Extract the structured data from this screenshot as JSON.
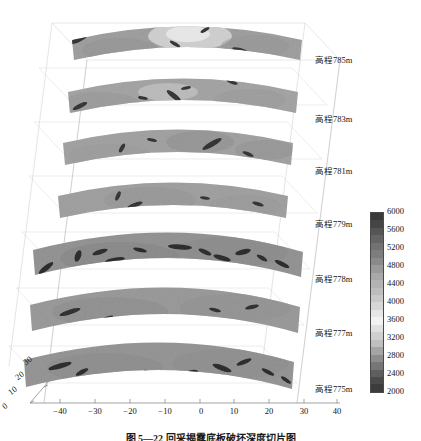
{
  "figure": {
    "kind": "3d-slice-stack",
    "background": "#ffffff",
    "caption": "图 5—22   回采揭露底板破坏深度切片图"
  },
  "chart_data": {
    "type": "heatmap",
    "title": "",
    "xlabel": "",
    "ylabel": "",
    "colorbar": {
      "label": "",
      "min": 2000,
      "max": 6000,
      "tick_step": 400,
      "ticks": [
        6000,
        5600,
        5200,
        4800,
        4400,
        4000,
        3600,
        3200,
        2800,
        2400,
        2000
      ],
      "colormap": "grayscale-banded",
      "colors": [
        "#3a3a3a",
        "#454545",
        "#555555",
        "#646464",
        "#727272",
        "#7d7d7d",
        "#8a8a8a",
        "#9a9a9a",
        "#a8a8a8",
        "#b3b3b3",
        "#bdbdbd",
        "#c9c9c9",
        "#d6d6d6",
        "#e6e6e6",
        "#f2f2f2",
        "#e0e0e0",
        "#cfcfcf",
        "#bfbfbf",
        "#a5a5a5",
        "#8d8d8d",
        "#767676",
        "#5e5e5e",
        "#4a4a4a",
        "#3c3c3c"
      ]
    },
    "x_axis": {
      "ticks": [
        -40,
        -30,
        -20,
        -10,
        0,
        10,
        20,
        30,
        40
      ],
      "labels": [
        "−40",
        "−30",
        "−20",
        "−10",
        "0",
        "10",
        "20",
        "30",
        "40"
      ],
      "range": [
        -45,
        45
      ]
    },
    "y_axis": {
      "ticks": [
        0,
        10,
        20,
        30
      ],
      "labels": [
        "0",
        "10",
        "20",
        "30"
      ],
      "range": [
        0,
        35
      ]
    },
    "z_slices": [
      {
        "index": 0,
        "label": "高程785m",
        "elevation": 785,
        "mean_value": 4300,
        "width_scale": 0.62,
        "base_color": "#9b9b9b"
      },
      {
        "index": 1,
        "label": "高程783m",
        "elevation": 783,
        "mean_value": 4200,
        "width_scale": 0.62,
        "base_color": "#a0a0a0"
      },
      {
        "index": 2,
        "label": "高程781m",
        "elevation": 781,
        "mean_value": 4150,
        "width_scale": 0.65,
        "base_color": "#9e9e9e"
      },
      {
        "index": 3,
        "label": "高程779m",
        "elevation": 779,
        "mean_value": 4100,
        "width_scale": 0.66,
        "base_color": "#9c9c9c"
      },
      {
        "index": 4,
        "label": "高程778m",
        "elevation": 778,
        "mean_value": 3900,
        "width_scale": 0.92,
        "base_color": "#8f8f8f"
      },
      {
        "index": 5,
        "label": "高程777m",
        "elevation": 777,
        "mean_value": 3950,
        "width_scale": 0.88,
        "base_color": "#959595"
      },
      {
        "index": 6,
        "label": "高程775m",
        "elevation": 775,
        "mean_value": 3850,
        "width_scale": 0.88,
        "base_color": "#919191"
      }
    ]
  },
  "elevation_labels": [
    {
      "text": "高程785m",
      "x": 315,
      "y": 59
    },
    {
      "text": "高程783m",
      "x": 315,
      "y": 118
    },
    {
      "text": "高程781m",
      "x": 315,
      "y": 170
    },
    {
      "text": "高程779m",
      "x": 315,
      "y": 223
    },
    {
      "text": "高程778m",
      "x": 315,
      "y": 278
    },
    {
      "text": "高程777m",
      "x": 315,
      "y": 332
    },
    {
      "text": "高程775m",
      "x": 315,
      "y": 388
    }
  ],
  "colorbar_ticks": [
    {
      "value": "6000",
      "y": 0
    },
    {
      "value": "5600",
      "y": 18
    },
    {
      "value": "5200",
      "y": 36
    },
    {
      "value": "4800",
      "y": 54
    },
    {
      "value": "4400",
      "y": 72
    },
    {
      "value": "4000",
      "y": 90
    },
    {
      "value": "3600",
      "y": 108
    },
    {
      "value": "3200",
      "y": 126
    },
    {
      "value": "2800",
      "y": 144
    },
    {
      "value": "2400",
      "y": 162
    },
    {
      "value": "2000",
      "y": 180
    }
  ],
  "x_ticks": [
    {
      "label": "−40",
      "x": 47
    },
    {
      "label": "−30",
      "x": 82
    },
    {
      "label": "−20",
      "x": 117
    },
    {
      "label": "−10",
      "x": 152
    },
    {
      "label": "0",
      "x": 188
    },
    {
      "label": "10",
      "x": 221
    },
    {
      "label": "20",
      "x": 256
    },
    {
      "label": "30",
      "x": 291
    },
    {
      "label": "40",
      "x": 324
    }
  ],
  "y_ticks": [
    {
      "label": "0",
      "x": 6,
      "y": 401
    },
    {
      "label": "10",
      "x": 12,
      "y": 387
    },
    {
      "label": "20",
      "x": 19,
      "y": 372
    },
    {
      "label": "30",
      "x": 27,
      "y": 357
    }
  ]
}
